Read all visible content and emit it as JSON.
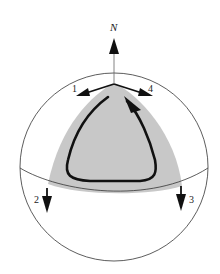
{
  "figure": {
    "pole_label": "N",
    "vector_labels": [
      "1",
      "2",
      "3",
      "4"
    ],
    "colors": {
      "background": "#ffffff",
      "sphere_outline": "#333333",
      "triangle_fill": "#c8c8c8",
      "arrows": "#111111"
    }
  }
}
